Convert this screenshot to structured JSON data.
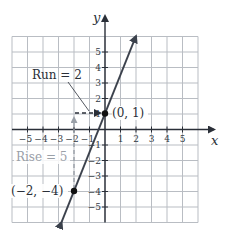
{
  "chart_data": {
    "type": "line",
    "title": "",
    "xlabel": "x",
    "ylabel": "y",
    "xlim": [
      -6,
      6
    ],
    "ylim": [
      -6,
      6
    ],
    "grid": true,
    "x_ticks": [
      -5,
      -4,
      -3,
      -2,
      -1,
      1,
      2,
      3,
      4,
      5
    ],
    "y_ticks": [
      -5,
      -4,
      -3,
      -2,
      -1,
      1,
      2,
      3,
      4,
      5
    ],
    "x_tick_labels": [
      "−5",
      "−4",
      "−3",
      "−2",
      "−1",
      "1",
      "2",
      "3",
      "4",
      "5"
    ],
    "y_tick_labels": [
      "−5",
      "−4",
      "−3",
      "−2",
      "−1",
      "1",
      "2",
      "3",
      "4",
      "5"
    ],
    "series": [
      {
        "name": "line",
        "equation": "y = (5/2)x + 1",
        "slope": 2.5,
        "intercept": 1,
        "x": [
          -2.8,
          2
        ],
        "y": [
          -6,
          6
        ],
        "arrows": "both",
        "color": "#3b414c"
      }
    ],
    "points": [
      {
        "x": 0,
        "y": 1,
        "label": "(0, 1)"
      },
      {
        "x": -2,
        "y": -4,
        "label": "(−2, −4)"
      }
    ],
    "annotations": [
      {
        "text": "Run = 2",
        "type": "dashed-arrow",
        "from": [
          -2,
          1
        ],
        "to": [
          0,
          1
        ],
        "color": "#2a2f38"
      },
      {
        "text": "Rise = 5",
        "type": "dashed-arrow",
        "from": [
          -2,
          -4
        ],
        "to": [
          -2,
          1
        ],
        "color": "#9aa0a8"
      }
    ]
  },
  "labels": {
    "x_axis": "x",
    "y_axis": "y",
    "run": "Run = 2",
    "rise": "Rise = 5",
    "point_a": "(0, 1)",
    "point_b": "(−2, −4)"
  },
  "colors": {
    "grid": "#b9bdc3",
    "axis": "#2a2f38",
    "line": "#3b414c",
    "rise": "#9aa0a8"
  }
}
